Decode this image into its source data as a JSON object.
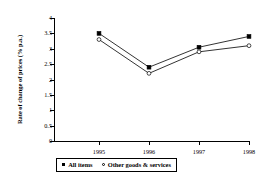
{
  "chart_data": {
    "type": "line",
    "title": "",
    "subtitle": "",
    "xlabel": "",
    "ylabel": "Rate of change of prices (% p.a.)",
    "categories": [
      "1995",
      "1996",
      "1997",
      "1998"
    ],
    "x": [
      1995,
      1996,
      1997,
      1998
    ],
    "series": [
      {
        "name": "All items",
        "marker": "filled-square",
        "color": "#000000",
        "values": [
          3.5,
          2.4,
          3.05,
          3.4
        ]
      },
      {
        "name": "Other goods & services",
        "marker": "open-circle",
        "color": "#000000",
        "values": [
          3.3,
          2.2,
          2.9,
          3.1
        ]
      }
    ],
    "ylim": [
      0,
      4
    ],
    "ytick_step": 0.5,
    "yticks": [
      "0",
      "0.5",
      "1",
      "1.5",
      "2",
      "2.5",
      "3",
      "3.5",
      "4"
    ],
    "xticks": [
      "1995",
      "1996",
      "1997",
      "1998"
    ],
    "grid": false,
    "legend_position": "bottom",
    "legend_border": true
  },
  "axes": {
    "y_title": "Rate of change of prices (% p.a.)",
    "y_tick_labels": [
      "4",
      "3.5",
      "3",
      "2.5",
      "2",
      "1.5",
      "1",
      "0.5",
      "0"
    ],
    "x_tick_labels": [
      "1995",
      "1996",
      "1997",
      "1998"
    ]
  },
  "legend": {
    "items": [
      {
        "label": "All items",
        "marker": "filled-square"
      },
      {
        "label": "Other goods & services",
        "marker": "open-circle"
      }
    ]
  },
  "colors": {
    "line": "#000000",
    "axis": "#000000",
    "background": "#ffffff"
  }
}
